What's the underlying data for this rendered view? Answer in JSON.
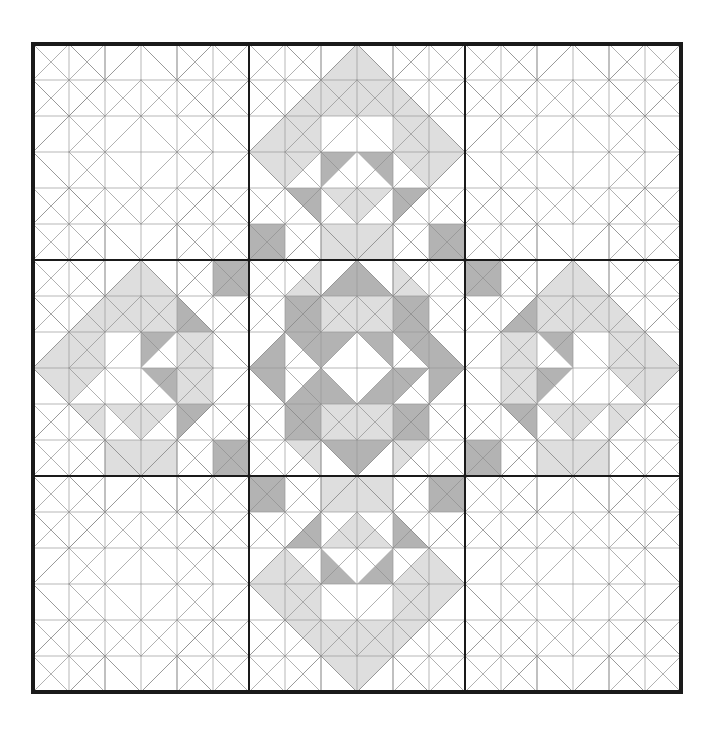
{
  "figure": {
    "layout": {
      "blocks_across": 3,
      "blocks_down": 3,
      "units_per_block": 6,
      "total_units_across": 18
    }
  },
  "geometry": {
    "origin_x": 33,
    "origin_y": 44,
    "block_size": 216,
    "unit_size": 36,
    "outer_border_width": 3.6,
    "block_divider_width": 2.6,
    "grid_line_width": 0.7,
    "diagonal_line_width": 0.7
  },
  "colors": {
    "background": "#ffffff",
    "fabric_light": "#ffffff",
    "fabric_medium": "#dedede",
    "fabric_dark": "#b3b3b3",
    "outline_heavy": "#1a1a1a",
    "outline_grid": "#9a9a9a",
    "outline_diagonal": "#8f8f8f",
    "edge_text": "#8a8a8a"
  },
  "legend": {
    "fabric_light_label": "Background (white)",
    "fabric_medium_label": "Light print",
    "fabric_dark_label": "Dark print"
  },
  "blocks": [
    {
      "row": 0,
      "col": 0,
      "name": "block-top-left",
      "shaded": false
    },
    {
      "row": 0,
      "col": 1,
      "name": "block-top-center",
      "shaded": true
    },
    {
      "row": 0,
      "col": 2,
      "name": "block-top-right",
      "shaded": false
    },
    {
      "row": 1,
      "col": 0,
      "name": "block-middle-left",
      "shaded": true
    },
    {
      "row": 1,
      "col": 1,
      "name": "block-center",
      "shaded": true
    },
    {
      "row": 1,
      "col": 2,
      "name": "block-middle-right",
      "shaded": true
    },
    {
      "row": 2,
      "col": 0,
      "name": "block-bottom-left",
      "shaded": false
    },
    {
      "row": 2,
      "col": 1,
      "name": "block-bottom-center",
      "shaded": true
    },
    {
      "row": 2,
      "col": 2,
      "name": "block-bottom-right",
      "shaded": false
    }
  ],
  "shading_maps": {
    "comment": "Per 6x6 unit block. Each entry [col,row,half,tone]; half is one of nw,ne,sw,se,n,s,e,w,full; tone is m (medium) or d (dark). Coordinates are 0-indexed from block top-left.",
    "top_center": [
      [
        2,
        0,
        "se",
        "m"
      ],
      [
        3,
        0,
        "sw",
        "m"
      ],
      [
        1,
        1,
        "se",
        "m"
      ],
      [
        2,
        1,
        "full",
        "m"
      ],
      [
        3,
        1,
        "full",
        "m"
      ],
      [
        4,
        1,
        "sw",
        "m"
      ],
      [
        0,
        2,
        "se",
        "m"
      ],
      [
        1,
        2,
        "ne",
        "m"
      ],
      [
        1,
        2,
        "sw",
        "m"
      ],
      [
        4,
        2,
        "nw",
        "m"
      ],
      [
        4,
        2,
        "se",
        "m"
      ],
      [
        5,
        2,
        "sw",
        "m"
      ],
      [
        0,
        3,
        "ne",
        "m"
      ],
      [
        1,
        3,
        "nw",
        "m"
      ],
      [
        2,
        3,
        "nw",
        "d"
      ],
      [
        3,
        3,
        "ne",
        "d"
      ],
      [
        4,
        3,
        "ne",
        "m"
      ],
      [
        5,
        3,
        "nw",
        "m"
      ],
      [
        1,
        4,
        "ne",
        "d"
      ],
      [
        2,
        4,
        "ne",
        "m"
      ],
      [
        3,
        4,
        "nw",
        "m"
      ],
      [
        4,
        4,
        "nw",
        "d"
      ],
      [
        0,
        5,
        "full",
        "d"
      ],
      [
        2,
        5,
        "full",
        "m"
      ],
      [
        3,
        5,
        "full",
        "m"
      ],
      [
        5,
        5,
        "full",
        "d"
      ]
    ],
    "middle_left": [
      [
        2,
        0,
        "se",
        "m"
      ],
      [
        3,
        0,
        "sw",
        "m"
      ],
      [
        5,
        0,
        "full",
        "d"
      ],
      [
        1,
        1,
        "se",
        "m"
      ],
      [
        2,
        1,
        "full",
        "m"
      ],
      [
        3,
        1,
        "full",
        "m"
      ],
      [
        4,
        1,
        "sw",
        "d"
      ],
      [
        0,
        2,
        "se",
        "m"
      ],
      [
        1,
        2,
        "ne",
        "m"
      ],
      [
        1,
        2,
        "sw",
        "m"
      ],
      [
        3,
        2,
        "nw",
        "d"
      ],
      [
        4,
        2,
        "full",
        "m"
      ],
      [
        0,
        3,
        "ne",
        "m"
      ],
      [
        1,
        3,
        "nw",
        "m"
      ],
      [
        3,
        3,
        "ne",
        "d"
      ],
      [
        4,
        3,
        "full",
        "m"
      ],
      [
        1,
        4,
        "ne",
        "m"
      ],
      [
        2,
        4,
        "ne",
        "m"
      ],
      [
        3,
        4,
        "nw",
        "m"
      ],
      [
        4,
        4,
        "nw",
        "d"
      ],
      [
        2,
        5,
        "full",
        "m"
      ],
      [
        3,
        5,
        "full",
        "m"
      ],
      [
        5,
        5,
        "full",
        "d"
      ]
    ],
    "center": [
      [
        1,
        0,
        "se",
        "m"
      ],
      [
        2,
        0,
        "se",
        "d"
      ],
      [
        3,
        0,
        "sw",
        "d"
      ],
      [
        4,
        0,
        "sw",
        "m"
      ],
      [
        1,
        1,
        "full",
        "d"
      ],
      [
        2,
        1,
        "full",
        "m"
      ],
      [
        3,
        1,
        "full",
        "m"
      ],
      [
        4,
        1,
        "full",
        "d"
      ],
      [
        0,
        2,
        "se",
        "d"
      ],
      [
        1,
        2,
        "ne",
        "d"
      ],
      [
        2,
        2,
        "nw",
        "d"
      ],
      [
        3,
        2,
        "ne",
        "d"
      ],
      [
        4,
        2,
        "ne",
        "d"
      ],
      [
        5,
        2,
        "sw",
        "d"
      ],
      [
        0,
        3,
        "ne",
        "d"
      ],
      [
        1,
        3,
        "se",
        "d"
      ],
      [
        2,
        3,
        "sw",
        "d"
      ],
      [
        3,
        3,
        "se",
        "d"
      ],
      [
        4,
        3,
        "nw",
        "d"
      ],
      [
        5,
        3,
        "nw",
        "d"
      ],
      [
        1,
        4,
        "full",
        "d"
      ],
      [
        2,
        4,
        "full",
        "m"
      ],
      [
        3,
        4,
        "full",
        "m"
      ],
      [
        4,
        4,
        "full",
        "d"
      ],
      [
        1,
        5,
        "ne",
        "m"
      ],
      [
        2,
        5,
        "ne",
        "d"
      ],
      [
        3,
        5,
        "nw",
        "d"
      ],
      [
        4,
        5,
        "nw",
        "m"
      ]
    ]
  }
}
